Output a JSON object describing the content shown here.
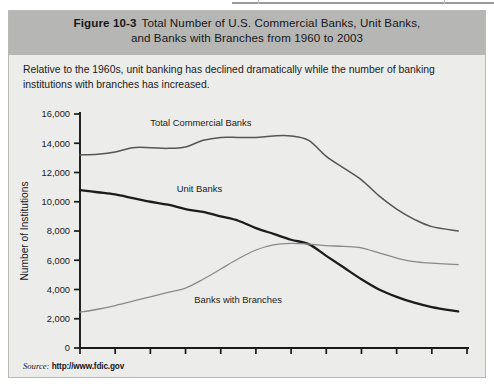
{
  "figure": {
    "label": "Figure 10-3",
    "title_line1": "Total Number of U.S. Commercial Banks, Unit Banks,",
    "title_line2": "and Banks with Branches from 1960 to 2003",
    "caption": "Relative to the 1960s, unit banking has declined dramatically while the number of banking institutions with branches has increased.",
    "source_word": "Source:",
    "source_url": "http://www.fdic.gov"
  },
  "colors": {
    "header_band": "#b6b6b4",
    "panel_background": "#ececea",
    "panel_border": "#b9b9b5",
    "axis": "#1a1a1c",
    "total_commercial_banks": "#555558",
    "unit_banks": "#1c1c1e",
    "banks_with_branches": "#8a8a8d",
    "text": "#1a1a1c"
  },
  "chart_data": {
    "type": "line",
    "title": "Total Number of U.S. Commercial Banks, Unit Banks, and Banks with Branches from 1960 to 2003",
    "xlabel": "",
    "ylabel": "Number of Institutions",
    "xlim": [
      1960,
      2004
    ],
    "ylim": [
      0,
      16000
    ],
    "ytick_labels": [
      "0",
      "2,000",
      "4,000",
      "6,000",
      "8,000",
      "10,000",
      "12,000",
      "14,000",
      "16,000"
    ],
    "yticks": [
      0,
      2000,
      4000,
      6000,
      8000,
      10000,
      12000,
      14000,
      16000
    ],
    "xticks": [
      1960,
      1964,
      1968,
      1972,
      1976,
      1980,
      1984,
      1988,
      1992,
      1996,
      2000,
      2004
    ],
    "xtick_labels": [
      "1960",
      "1964",
      "1968",
      "1972",
      "1976",
      "1980",
      "1984",
      "1988",
      "1992",
      "1996",
      "2000",
      "2004"
    ],
    "grid": false,
    "legend": "inline-labels",
    "x": [
      1960,
      1962,
      1964,
      1966,
      1968,
      1970,
      1972,
      1974,
      1976,
      1978,
      1980,
      1982,
      1984,
      1986,
      1988,
      1990,
      1992,
      1994,
      1996,
      1998,
      2000,
      2003
    ],
    "series": [
      {
        "name": "Total Commercial Banks",
        "label_position": {
          "x": 1968,
          "y": 15200
        },
        "color": "#555558",
        "values": [
          13200,
          13250,
          13400,
          13700,
          13700,
          13650,
          13750,
          14200,
          14400,
          14400,
          14400,
          14500,
          14500,
          14200,
          13100,
          12300,
          11500,
          10400,
          9500,
          8800,
          8300,
          8000
        ]
      },
      {
        "name": "Unit Banks",
        "label_position": {
          "x": 1971,
          "y": 10700
        },
        "color": "#1c1c1e",
        "values": [
          10800,
          10650,
          10500,
          10250,
          10000,
          9800,
          9500,
          9300,
          9000,
          8700,
          8200,
          7800,
          7400,
          7100,
          6300,
          5500,
          4700,
          4000,
          3500,
          3100,
          2800,
          2500
        ]
      },
      {
        "name": "Banks with Branches",
        "label_position": {
          "x": 1973,
          "y": 3100
        },
        "color": "#8a8a8d",
        "values": [
          2450,
          2650,
          2900,
          3200,
          3500,
          3800,
          4100,
          4700,
          5400,
          6100,
          6700,
          7050,
          7150,
          7100,
          7000,
          6950,
          6850,
          6500,
          6150,
          5900,
          5800,
          5700
        ]
      }
    ]
  }
}
